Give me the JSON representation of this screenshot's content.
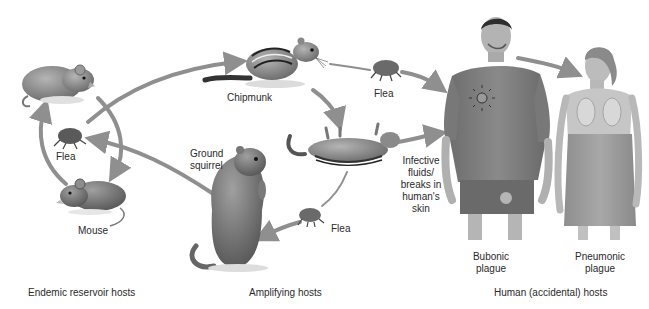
{
  "diagram": {
    "colors": {
      "arrow": "#8f8f8f",
      "animal_dark": "#5a5a5a",
      "animal_mid": "#8a8a8a",
      "animal_light": "#c4c4c4",
      "human_shirt": "#7c7c7c",
      "human_skin": "#bdbdbd",
      "text": "#2a2a2a",
      "background": "#ffffff"
    },
    "labels": {
      "flea_left": "Flea",
      "mouse": "Mouse",
      "chipmunk": "Chipmunk",
      "flea_top": "Flea",
      "ground_squirrel": "Ground squirrel",
      "flea_bottom": "Flea",
      "infective": "Infective fluids/ breaks in human's skin",
      "bubonic": "Bubonic plague",
      "pneumonic": "Pneumonic plague"
    },
    "sections": {
      "endemic": "Endemic reservoir hosts",
      "amplifying": "Amplifying hosts",
      "human": "Human (accidental) hosts"
    },
    "nodes": [
      {
        "id": "rat",
        "group": "endemic"
      },
      {
        "id": "flea_left",
        "group": "endemic"
      },
      {
        "id": "mouse",
        "group": "endemic"
      },
      {
        "id": "chipmunk",
        "group": "amplifying"
      },
      {
        "id": "dead_chipmunk",
        "group": "amplifying"
      },
      {
        "id": "ground_squirrel",
        "group": "amplifying"
      },
      {
        "id": "flea_top",
        "group": "amplifying"
      },
      {
        "id": "flea_bottom",
        "group": "amplifying"
      },
      {
        "id": "bubonic_man",
        "group": "human"
      },
      {
        "id": "pneumonic_woman",
        "group": "human"
      }
    ],
    "edges": [
      {
        "from": "flea_left",
        "to": "chipmunk"
      },
      {
        "from": "rat",
        "to": "mouse"
      },
      {
        "from": "mouse",
        "to": "rat"
      },
      {
        "from": "ground_squirrel",
        "to": "flea_left"
      },
      {
        "from": "chipmunk",
        "to": "flea_top"
      },
      {
        "from": "flea_top",
        "to": "bubonic_man"
      },
      {
        "from": "chipmunk",
        "to": "dead_chipmunk"
      },
      {
        "from": "dead_chipmunk",
        "to": "bubonic_man"
      },
      {
        "from": "dead_chipmunk",
        "to": "flea_bottom"
      },
      {
        "from": "flea_bottom",
        "to": "ground_squirrel"
      },
      {
        "from": "bubonic_man",
        "to": "pneumonic_woman"
      }
    ]
  }
}
